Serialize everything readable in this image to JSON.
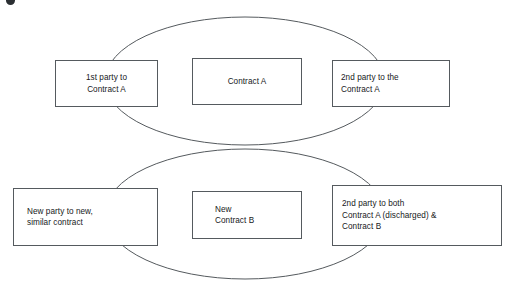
{
  "diagram": {
    "type": "venn-two-overlapping-ellipses-with-boxes",
    "stroke_color": "#555a5e",
    "text_color": "#17191b",
    "background": "#ffffff",
    "corner_mark": "bullet-glyph",
    "ellipses": [
      {
        "name": "upper-contract-a-ellipse",
        "cx": 245,
        "cy": 81,
        "rx": 140,
        "ry": 64
      },
      {
        "name": "lower-contract-b-ellipse",
        "cx": 245,
        "cy": 214,
        "rx": 140,
        "ry": 65
      }
    ],
    "boxes": [
      {
        "id": "party1-a",
        "name": "first-party-contract-a-box",
        "text": "1st party to\nContract A",
        "align": "center",
        "row": "upper",
        "column": "left"
      },
      {
        "id": "contract-a",
        "name": "contract-a-box",
        "text": "Contract A",
        "align": "center",
        "row": "upper",
        "column": "center"
      },
      {
        "id": "party2-a",
        "name": "second-party-contract-a-box",
        "text": "2nd party to the\nContract A",
        "align": "left",
        "row": "upper",
        "column": "right"
      },
      {
        "id": "new-party",
        "name": "new-party-similar-contract-box",
        "text": "New party to new,\nsimilar contract",
        "align": "left",
        "row": "lower",
        "column": "left"
      },
      {
        "id": "contract-b",
        "name": "new-contract-b-box",
        "text": "New\nContract B",
        "align": "left",
        "row": "lower",
        "column": "center"
      },
      {
        "id": "party2-ab",
        "name": "second-party-both-contracts-box",
        "text": "2nd party to both\nContract A (discharged) &\nContract B",
        "align": "left",
        "row": "lower",
        "column": "right"
      }
    ]
  }
}
